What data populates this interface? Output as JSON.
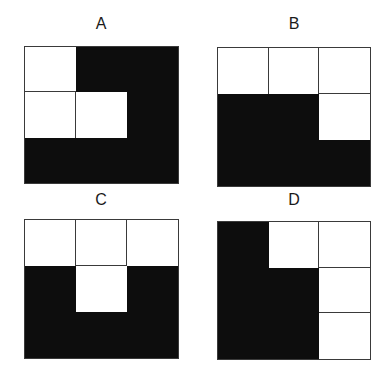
{
  "figure": {
    "panels": [
      {
        "label": "A",
        "cells": [
          [
            "white",
            "black",
            "black"
          ],
          [
            "white",
            "white",
            "black"
          ],
          [
            "black",
            "black",
            "black"
          ]
        ]
      },
      {
        "label": "B",
        "cells": [
          [
            "white",
            "white",
            "white"
          ],
          [
            "black",
            "black",
            "white"
          ],
          [
            "black",
            "black",
            "black"
          ]
        ]
      },
      {
        "label": "C",
        "cells": [
          [
            "white",
            "white",
            "white"
          ],
          [
            "black",
            "white",
            "black"
          ],
          [
            "black",
            "black",
            "black"
          ]
        ]
      },
      {
        "label": "D",
        "cells": [
          [
            "black",
            "white",
            "white"
          ],
          [
            "black",
            "black",
            "white"
          ],
          [
            "black",
            "black",
            "white"
          ]
        ]
      }
    ],
    "colors": {
      "filled": "#0d0d0d",
      "empty": "#ffffff",
      "gridline": "#3a3a3a",
      "label": "#1a1a1a"
    }
  }
}
